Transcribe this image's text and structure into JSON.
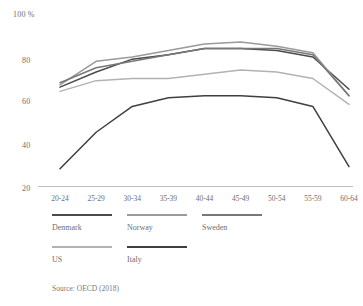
{
  "chart_data": {
    "type": "line",
    "title": "",
    "xlabel": "",
    "ylabel": "100 %",
    "ylim": [
      20,
      100
    ],
    "grid": false,
    "legend_position": "bottom",
    "categories": [
      "20-24",
      "25-29",
      "30-34",
      "35-39",
      "40-44",
      "45-49",
      "50-54",
      "55-59",
      "60-64"
    ],
    "ytick_labels": [
      "100 %",
      "80",
      "60",
      "40",
      "20"
    ],
    "ytick_values": [
      100,
      80,
      60,
      40,
      20
    ],
    "series": [
      {
        "name": "Denmark",
        "color": "#4a4a4a",
        "values": [
          66,
          73,
          79,
          81,
          84,
          84,
          83,
          80,
          65
        ]
      },
      {
        "name": "Norway",
        "color": "#9a9a9a",
        "values": [
          67,
          78,
          80,
          83,
          86,
          87,
          85,
          82,
          62
        ]
      },
      {
        "name": "Sweden",
        "color": "#777777",
        "values": [
          68,
          75,
          78,
          81,
          84,
          84,
          84,
          81,
          62
        ]
      },
      {
        "name": "US",
        "color": "#b2b2b2",
        "values": [
          64,
          69,
          70,
          70,
          72,
          74,
          73,
          70,
          58
        ]
      },
      {
        "name": "Italy",
        "color": "#3f3f3f",
        "values": [
          28,
          45,
          57,
          61,
          62,
          62,
          61,
          57,
          29
        ]
      }
    ],
    "annotations": [
      "Source: OECD (2018)"
    ]
  },
  "legend": {
    "rows": [
      [
        {
          "label": "Denmark",
          "color": "#4a4a4a"
        },
        {
          "label": "Norway",
          "color": "#9a9a9a"
        },
        {
          "label": "Sweden",
          "color": "#777777"
        }
      ],
      [
        {
          "label": "US",
          "color": "#b2b2b2"
        },
        {
          "label": "Italy",
          "color": "#3f3f3f"
        }
      ]
    ]
  },
  "source": "Source: OECD (2018)"
}
